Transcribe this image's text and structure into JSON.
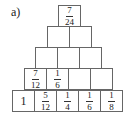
{
  "label": "a)",
  "pyramid": {
    "rows": [
      {
        "cells": [
          {
            "num": "7",
            "den": "24"
          }
        ]
      },
      {
        "cells": [
          {},
          {}
        ]
      },
      {
        "cells": [
          {},
          {},
          {}
        ]
      },
      {
        "cells": [
          {
            "num": "7",
            "den": "12"
          },
          {
            "num": "1",
            "den": "6"
          },
          {},
          {}
        ]
      },
      {
        "cells": [
          {
            "whole": "1"
          },
          {
            "num": "5",
            "den": "12"
          },
          {
            "num": "1",
            "den": "4"
          },
          {
            "num": "1",
            "den": "6"
          },
          {
            "num": "1",
            "den": "8"
          }
        ]
      }
    ]
  },
  "layout": {
    "cell_w": 23,
    "cell_h": 22,
    "rows": [
      {
        "x": 58,
        "y": 5
      },
      {
        "x": 47,
        "y": 26
      },
      {
        "x": 35,
        "y": 47
      },
      {
        "x": 24,
        "y": 68
      },
      {
        "x": 12,
        "y": 90
      }
    ]
  }
}
